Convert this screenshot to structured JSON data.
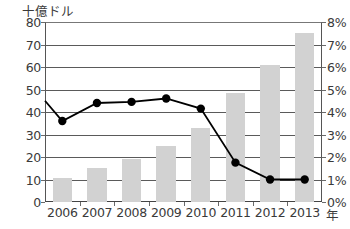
{
  "chart_data": {
    "type": "bar",
    "title": "",
    "subtitle": "",
    "categories": [
      "2006",
      "2007",
      "2008",
      "2009",
      "2010",
      "2011",
      "2012",
      "2013"
    ],
    "xlabel": "年",
    "ylabel": "十億ドル",
    "ylabel_right": "",
    "ylim": [
      0,
      80
    ],
    "ylim_right": [
      0,
      8
    ],
    "grid": true,
    "legend_position": "none",
    "series": [
      {
        "name": "金額",
        "type": "bar",
        "axis": "left",
        "unit": "十億ドル",
        "color": "#d2d2d2",
        "values": [
          10.5,
          15,
          19,
          25,
          33,
          48.5,
          61,
          75
        ]
      },
      {
        "name": "比率",
        "type": "line",
        "axis": "right",
        "unit": "%",
        "color": "#000000",
        "values": [
          3.6,
          4.4,
          4.45,
          4.6,
          4.15,
          1.75,
          1.0,
          1.0
        ],
        "lead_in_value": 4.5
      }
    ],
    "yticks_left": [
      "0",
      "10",
      "20",
      "30",
      "40",
      "50",
      "60",
      "70",
      "80"
    ],
    "yticks_right": [
      "0%",
      "1%",
      "2%",
      "3%",
      "4%",
      "5%",
      "6%",
      "7%",
      "8%"
    ]
  },
  "axis": {
    "left_unit_label": "十億ドル",
    "x_unit_label": "年"
  }
}
